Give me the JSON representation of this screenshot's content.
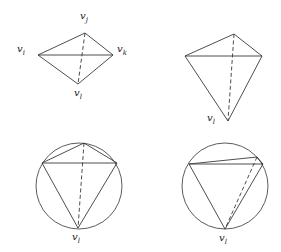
{
  "figures": [
    {
      "id": "tetrahedron-labeled",
      "vertices": {
        "vi": [
          38,
          55
        ],
        "vj": [
          85,
          33
        ],
        "vk": [
          113,
          55
        ],
        "vl": [
          78,
          84
        ]
      },
      "labels": {
        "vi": {
          "base": "v",
          "sub": "i"
        },
        "vj": {
          "base": "v",
          "sub": "j"
        },
        "vk": {
          "base": "v",
          "sub": "k"
        },
        "vl": {
          "base": "v",
          "sub": "l"
        }
      },
      "solid_edges": [
        [
          "vi",
          "vj"
        ],
        [
          "vj",
          "vk"
        ],
        [
          "vi",
          "vk"
        ],
        [
          "vi",
          "vl"
        ],
        [
          "vk",
          "vl"
        ]
      ],
      "dashed_edges": [
        [
          "vj",
          "vl"
        ]
      ]
    },
    {
      "id": "tetrahedron-elongated",
      "vertices": {
        "left": [
          185,
          56
        ],
        "top": [
          234,
          34
        ],
        "right": [
          262,
          56
        ],
        "vl": [
          228,
          121
        ]
      },
      "labels": {
        "vl": {
          "base": "v",
          "sub": "l"
        }
      },
      "solid_edges": [
        [
          "left",
          "top"
        ],
        [
          "top",
          "right"
        ],
        [
          "left",
          "right"
        ],
        [
          "left",
          "vl"
        ],
        [
          "right",
          "vl"
        ]
      ],
      "dashed_edges": [
        [
          "top",
          "vl"
        ]
      ]
    },
    {
      "id": "inscribed-quadrilateral-1",
      "circle": {
        "cx": 79,
        "cy": 186,
        "r": 43
      },
      "vertices": {
        "top": [
          84,
          143
        ],
        "left": [
          42,
          163
        ],
        "right": [
          117,
          163
        ],
        "vl": [
          78,
          228
        ]
      },
      "labels": {
        "vl": {
          "base": "v",
          "sub": "l"
        }
      },
      "solid_edges": [
        [
          "left",
          "top"
        ],
        [
          "top",
          "right"
        ],
        [
          "left",
          "right"
        ],
        [
          "left",
          "vl"
        ],
        [
          "right",
          "vl"
        ]
      ],
      "dashed_edges": [
        [
          "top",
          "vl"
        ]
      ]
    },
    {
      "id": "inscribed-quadrilateral-2",
      "circle": {
        "cx": 225,
        "cy": 186,
        "r": 43
      },
      "vertices": {
        "left": [
          189,
          164
        ],
        "upper_right": [
          257,
          157
        ],
        "right": [
          263,
          164
        ],
        "vl": [
          225,
          229
        ]
      },
      "labels": {
        "vl": {
          "base": "v",
          "sub": "l"
        }
      },
      "solid_edges": [
        [
          "left",
          "upper_right"
        ],
        [
          "upper_right",
          "right"
        ],
        [
          "left",
          "right"
        ],
        [
          "left",
          "vl"
        ],
        [
          "right",
          "vl"
        ]
      ],
      "dashed_edges": [
        [
          "upper_right",
          "vl"
        ]
      ]
    }
  ],
  "text_labels": {
    "fig1_vi": "v",
    "fig1_vi_sub": "i",
    "fig1_vj": "v",
    "fig1_vj_sub": "j",
    "fig1_vk": "v",
    "fig1_vk_sub": "k",
    "fig1_vl": "v",
    "fig1_vl_sub": "l",
    "fig2_vl": "v",
    "fig2_vl_sub": "l",
    "fig3_vl": "v",
    "fig3_vl_sub": "l",
    "fig4_vl": "v",
    "fig4_vl_sub": "l"
  }
}
